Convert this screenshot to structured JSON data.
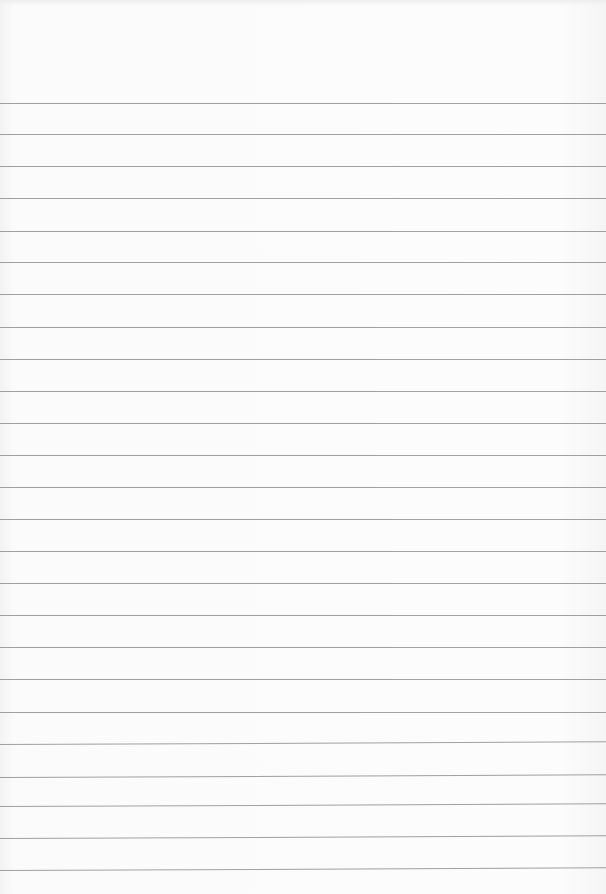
{
  "page": {
    "type": "ruled-paper",
    "background": "#fbfbfb",
    "rule_color": "#8f8f8f",
    "rule_count": 25,
    "rules_y": [
      103,
      134,
      166,
      198,
      231,
      262,
      294,
      327,
      359,
      391,
      423,
      455,
      487,
      519,
      551,
      583,
      615,
      647,
      679,
      712,
      744,
      777,
      806,
      838,
      870
    ]
  }
}
